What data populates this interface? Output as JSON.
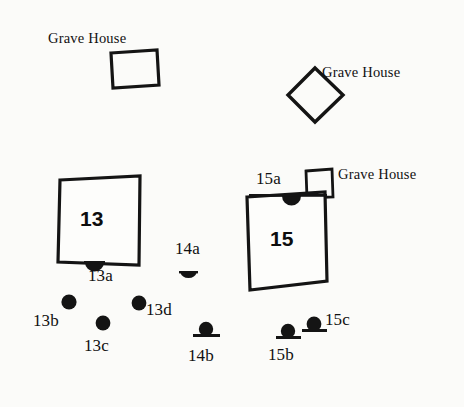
{
  "figure": {
    "kind": "archaeological-site-plan",
    "background_color": "#fbfbf9",
    "ink_color": "#111111",
    "width": 464,
    "height": 407
  },
  "structures": [
    {
      "id": "grave-house-northwest",
      "label": "Grave House",
      "shape": "rectangle-outline",
      "label_x": 48,
      "label_y": 31
    },
    {
      "id": "grave-house-northeast",
      "label": "Grave House",
      "shape": "diamond-outline",
      "label_x": 322,
      "label_y": 65
    },
    {
      "id": "grave-house-east",
      "label": "Grave House",
      "shape": "small-rectangle-outline",
      "label_x": 338,
      "label_y": 167
    }
  ],
  "buildings": [
    {
      "id": "building-13",
      "number": "13",
      "number_x": 80,
      "number_y": 208
    },
    {
      "id": "building-15",
      "number": "15",
      "number_x": 270,
      "number_y": 228
    }
  ],
  "features": [
    {
      "id": "feature-13a",
      "label": "13a",
      "marker": "dome",
      "label_x": 88,
      "label_y": 267
    },
    {
      "id": "feature-13b",
      "label": "13b",
      "marker": "dot",
      "label_x": 33,
      "label_y": 312
    },
    {
      "id": "feature-13c",
      "label": "13c",
      "marker": "dot",
      "label_x": 84,
      "label_y": 337
    },
    {
      "id": "feature-13d",
      "label": "13d",
      "marker": "dot",
      "label_x": 146,
      "label_y": 301
    },
    {
      "id": "feature-14a",
      "label": "14a",
      "marker": "dome",
      "label_x": 175,
      "label_y": 240
    },
    {
      "id": "feature-14b",
      "label": "14b",
      "marker": "dot-on-base",
      "label_x": 188,
      "label_y": 347
    },
    {
      "id": "feature-15a",
      "label": "15a",
      "marker": "dome",
      "label_x": 256,
      "label_y": 170
    },
    {
      "id": "feature-15b",
      "label": "15b",
      "marker": "dot-on-base",
      "label_x": 268,
      "label_y": 346
    },
    {
      "id": "feature-15c",
      "label": "15c",
      "marker": "dot-on-base",
      "label_x": 325,
      "label_y": 311
    }
  ]
}
